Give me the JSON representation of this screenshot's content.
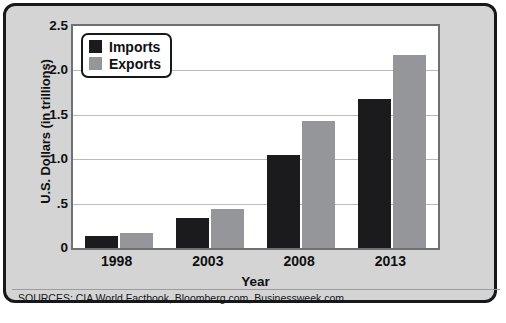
{
  "chart_data": {
    "type": "bar",
    "title": "",
    "categories": [
      "1998",
      "2003",
      "2008",
      "2013"
    ],
    "series": [
      {
        "name": "Imports",
        "color": "#1b1b1d",
        "values": [
          0.13,
          0.34,
          1.05,
          1.68
        ]
      },
      {
        "name": "Exports",
        "color": "#949699",
        "values": [
          0.17,
          0.44,
          1.43,
          2.17
        ]
      }
    ],
    "xlabel": "Year",
    "ylabel": "U.S. Dollars (in trillions)",
    "ylim": [
      0,
      2.5
    ],
    "yticks": [
      0,
      0.5,
      1.0,
      1.5,
      2.0,
      2.5
    ],
    "ytick_labels": [
      "0",
      ".5",
      "1.0",
      "1.5",
      "2.0",
      "2.5"
    ],
    "grid": true,
    "legend_position": "top-left"
  },
  "legend": {
    "items": [
      {
        "label": "Imports",
        "swatch": "imports-swatch"
      },
      {
        "label": "Exports",
        "swatch": "exports-swatch"
      }
    ]
  },
  "footer": {
    "sources": "SOURCES: CIA World Factbook, Bloomberg.com, Businessweek.com"
  },
  "colors": {
    "imports": "#1b1b1d",
    "exports": "#949699",
    "panel_background": "#d4d4d4",
    "plot_background": "#ffffff",
    "frame_border": "#17181a",
    "gridline": "#b9bbbd"
  }
}
